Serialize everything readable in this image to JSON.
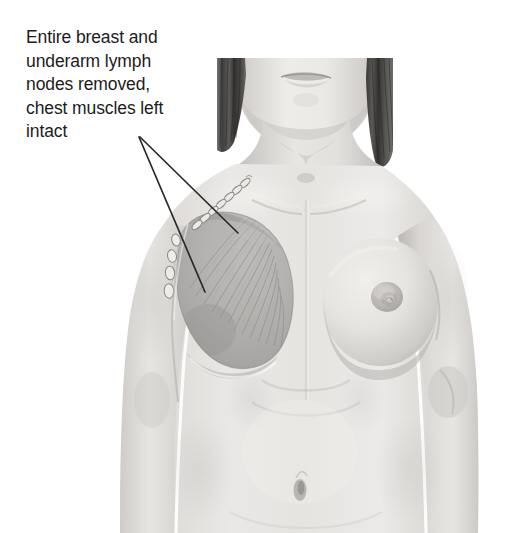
{
  "annotation": {
    "text": "Entire breast and\nunderarm lymph\nnodes removed,\nchest muscles left\nintact",
    "lines": [
      "Entire breast and",
      "underarm lymph",
      "nodes removed,",
      "chest muscles left",
      "intact"
    ],
    "text_color": "#1c1c1c",
    "font_size_px": 17.5
  },
  "leader_lines": {
    "count": 2,
    "origin": {
      "x": 140,
      "y": 137
    },
    "color": "#2a2a2a",
    "stroke_width": 1.6,
    "targets": [
      {
        "label": "chest-muscle-upper",
        "x": 238,
        "y": 233
      },
      {
        "label": "chest-muscle-lower",
        "x": 205,
        "y": 292
      }
    ]
  },
  "illustration": {
    "subject": "female-torso-front-view",
    "style": "grayscale-medical-illustration",
    "background_color": "#ffffff",
    "crop": "cropped at mouth and at hips",
    "skin_light": "#e9e7e5",
    "skin_mid": "#d2cfcc",
    "skin_shadow": "#b4b0ad",
    "hair_color": "#4a4846",
    "hair_highlight": "#6e6c69",
    "muscle_color": "#b0aeac",
    "muscle_fiber_color": "#9b9997",
    "suture_color": "#cfccc9",
    "lymph_node_color": "#e5e3e0",
    "parts": [
      {
        "name": "face-chin-mouth",
        "cx": 300,
        "cy": 95
      },
      {
        "name": "hair-left",
        "x": 217,
        "y": 58
      },
      {
        "name": "hair-right",
        "x": 358,
        "y": 58
      },
      {
        "name": "neck",
        "cx": 300,
        "cy": 140
      },
      {
        "name": "mastectomy-site-left-chest",
        "cx": 234,
        "cy": 290,
        "rx": 58,
        "ry": 78
      },
      {
        "name": "pectoral-muscle-fan",
        "cx": 248,
        "cy": 238
      },
      {
        "name": "suture-scar-chain",
        "from_x": 248,
        "from_y": 178,
        "to_x": 193,
        "to_y": 228
      },
      {
        "name": "lymph-node-chain-axilla",
        "x": 168,
        "y": 248,
        "node_count": 4
      },
      {
        "name": "intact-breast-right",
        "cx": 380,
        "cy": 300,
        "rx": 55,
        "ry": 62
      },
      {
        "name": "nipple-areola-right",
        "cx": 387,
        "cy": 297,
        "r": 14
      },
      {
        "name": "left-arm",
        "cx": 150,
        "cy": 330
      },
      {
        "name": "right-arm",
        "cx": 450,
        "cy": 330
      },
      {
        "name": "sternum-midline",
        "cx": 305,
        "cy": 330
      },
      {
        "name": "navel",
        "cx": 300,
        "cy": 490
      },
      {
        "name": "abdomen",
        "cx": 300,
        "cy": 460
      }
    ]
  }
}
